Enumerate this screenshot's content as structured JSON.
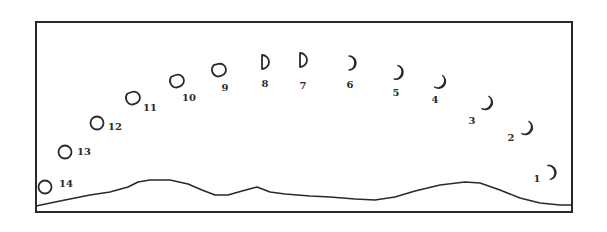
{
  "diagram": {
    "type": "moon-phase-sequence",
    "frame": {
      "x": 36,
      "y": 22,
      "width": 536,
      "height": 190
    },
    "ink_color": "#2a2a2a",
    "background_color": "#ffffff",
    "horizon_points": [
      [
        36,
        206
      ],
      [
        60,
        201
      ],
      [
        90,
        195
      ],
      [
        110,
        192
      ],
      [
        128,
        187
      ],
      [
        138,
        182
      ],
      [
        150,
        180
      ],
      [
        170,
        180
      ],
      [
        188,
        184
      ],
      [
        202,
        190
      ],
      [
        215,
        195
      ],
      [
        228,
        195
      ],
      [
        242,
        191
      ],
      [
        257,
        187
      ],
      [
        270,
        192
      ],
      [
        285,
        194
      ],
      [
        310,
        196
      ],
      [
        330,
        197
      ],
      [
        355,
        199
      ],
      [
        375,
        200
      ],
      [
        395,
        197
      ],
      [
        415,
        191
      ],
      [
        440,
        185
      ],
      [
        465,
        182
      ],
      [
        480,
        183
      ],
      [
        500,
        190
      ],
      [
        520,
        198
      ],
      [
        540,
        203
      ],
      [
        560,
        205
      ],
      [
        572,
        205
      ]
    ],
    "moons": [
      {
        "label": "1",
        "phase": "crescent",
        "cx": 552,
        "cy": 172,
        "label_x": 537,
        "label_y": 179,
        "rotation": -10
      },
      {
        "label": "2",
        "phase": "crescent",
        "cx": 528,
        "cy": 129,
        "label_x": 511,
        "label_y": 138,
        "rotation": 30
      },
      {
        "label": "3",
        "phase": "crescent",
        "cx": 488,
        "cy": 104,
        "label_x": 472,
        "label_y": 121,
        "rotation": 30
      },
      {
        "label": "4",
        "phase": "crescent",
        "cx": 441,
        "cy": 83,
        "label_x": 435,
        "label_y": 100,
        "rotation": 35
      },
      {
        "label": "5",
        "phase": "crescent",
        "cx": 399,
        "cy": 73,
        "label_x": 396,
        "label_y": 93,
        "rotation": 15
      },
      {
        "label": "6",
        "phase": "crescent",
        "cx": 352,
        "cy": 63,
        "label_x": 350,
        "label_y": 85,
        "rotation": 0
      },
      {
        "label": "7",
        "phase": "half",
        "cx": 303,
        "cy": 60,
        "label_x": 303,
        "label_y": 86,
        "rotation": 0
      },
      {
        "label": "8",
        "phase": "half",
        "cx": 265,
        "cy": 62,
        "label_x": 265,
        "label_y": 84,
        "rotation": 0
      },
      {
        "label": "9",
        "phase": "gibbous-d",
        "cx": 219,
        "cy": 70,
        "label_x": 225,
        "label_y": 88,
        "rotation": -15
      },
      {
        "label": "10",
        "phase": "gibbous-d",
        "cx": 177,
        "cy": 81,
        "label_x": 189,
        "label_y": 98,
        "rotation": -20
      },
      {
        "label": "11",
        "phase": "gibbous-d",
        "cx": 133,
        "cy": 98,
        "label_x": 150,
        "label_y": 108,
        "rotation": -20
      },
      {
        "label": "12",
        "phase": "full",
        "cx": 97,
        "cy": 123,
        "label_x": 115,
        "label_y": 127,
        "rotation": 0
      },
      {
        "label": "13",
        "phase": "full",
        "cx": 65,
        "cy": 152,
        "label_x": 84,
        "label_y": 152,
        "rotation": 0
      },
      {
        "label": "14",
        "phase": "full",
        "cx": 45,
        "cy": 187,
        "label_x": 66,
        "label_y": 184,
        "rotation": 0
      }
    ]
  }
}
